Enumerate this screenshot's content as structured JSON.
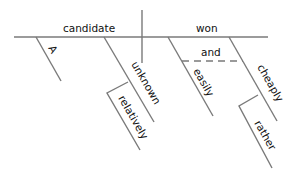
{
  "diagram": {
    "type": "sentence-diagram",
    "sentence_parts": {
      "subject": "candidate",
      "verb": "won",
      "subject_modifiers": [
        "A",
        "unknown"
      ],
      "modifier_of_unknown": "relatively",
      "verb_modifiers": [
        "easily",
        "cheaply"
      ],
      "conjunction": "and",
      "modifier_of_cheaply": "rather"
    },
    "labels": {
      "subject": "candidate",
      "verb": "won",
      "article": "A",
      "adjective": "unknown",
      "adverb_relatively": "relatively",
      "adverb_easily": "easily",
      "conjunction": "and",
      "adverb_cheaply": "cheaply",
      "adverb_rather": "rather"
    },
    "line_color": "#7a7a7a",
    "text_color": "#111111"
  }
}
